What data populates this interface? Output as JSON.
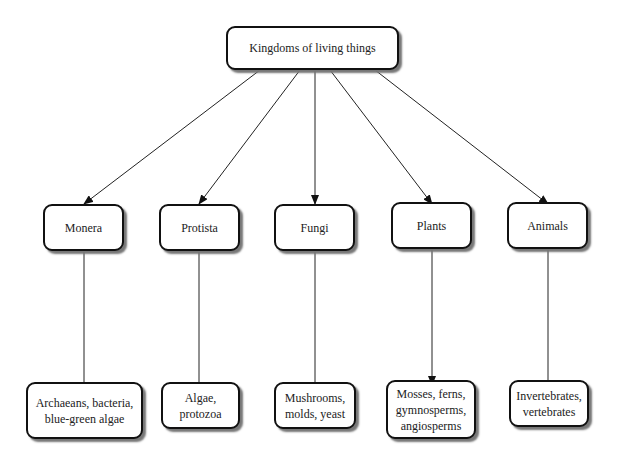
{
  "root": {
    "label": "Kingdoms of living things"
  },
  "kingdoms": [
    {
      "label": "Monera",
      "examples": "Archaeans, bacteria,\nblue-green algae"
    },
    {
      "label": "Protista",
      "examples": "Algae,\nprotozoa"
    },
    {
      "label": "Fungi",
      "examples": "Mushrooms,\nmolds, yeast"
    },
    {
      "label": "Plants",
      "examples": "Mosses, ferns,\ngymnosperms,\nangiosperms"
    },
    {
      "label": "Animals",
      "examples": "Invertebrates,\nvertebrates"
    }
  ]
}
